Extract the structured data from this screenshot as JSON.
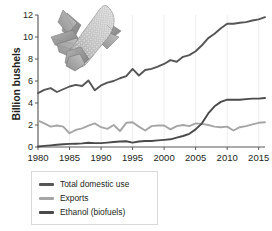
{
  "chart_data": {
    "type": "line",
    "title": "",
    "xlabel": "",
    "ylabel": "Billion bushels",
    "xlim": [
      1980,
      2016
    ],
    "ylim": [
      0,
      12
    ],
    "xticks": [
      1980,
      1985,
      1990,
      1995,
      2000,
      2005,
      2010,
      2015
    ],
    "yticks": [
      0,
      2,
      4,
      6,
      8,
      10,
      12
    ],
    "grid": "vertical",
    "legend_position": "below-left",
    "x": [
      1980,
      1981,
      1982,
      1983,
      1984,
      1985,
      1986,
      1987,
      1988,
      1989,
      1990,
      1991,
      1992,
      1993,
      1994,
      1995,
      1996,
      1997,
      1998,
      1999,
      2000,
      2001,
      2002,
      2003,
      2004,
      2005,
      2006,
      2007,
      2008,
      2009,
      2010,
      2011,
      2012,
      2013,
      2014,
      2015,
      2016
    ],
    "series": [
      {
        "name": "Total domestic use",
        "color": "#565656",
        "values": [
          4.9,
          5.2,
          5.35,
          5.0,
          5.25,
          5.5,
          5.65,
          5.55,
          6.05,
          5.15,
          5.6,
          5.85,
          6.0,
          6.25,
          6.45,
          7.1,
          6.5,
          7.0,
          7.1,
          7.3,
          7.55,
          7.9,
          7.75,
          8.2,
          8.35,
          8.7,
          9.25,
          9.9,
          10.3,
          10.8,
          11.2,
          11.2,
          11.3,
          11.35,
          11.5,
          11.6,
          11.8
        ]
      },
      {
        "name": "Exports",
        "color": "#a6a6a6",
        "values": [
          2.4,
          2.15,
          1.85,
          1.95,
          1.85,
          1.25,
          1.55,
          1.7,
          1.95,
          2.15,
          1.8,
          1.65,
          2.0,
          1.45,
          2.2,
          2.25,
          1.85,
          1.5,
          1.9,
          1.95,
          1.95,
          1.6,
          1.9,
          2.0,
          1.9,
          2.15,
          2.1,
          2.0,
          1.85,
          1.8,
          1.85,
          1.5,
          1.8,
          1.9,
          2.05,
          2.2,
          2.25
        ]
      },
      {
        "name": "Ethanol (biofuels)",
        "color": "#4a4a4a",
        "values": [
          0.05,
          0.1,
          0.15,
          0.2,
          0.25,
          0.28,
          0.3,
          0.33,
          0.38,
          0.35,
          0.35,
          0.4,
          0.45,
          0.5,
          0.52,
          0.4,
          0.5,
          0.55,
          0.55,
          0.6,
          0.65,
          0.7,
          0.85,
          1.0,
          1.2,
          1.6,
          2.15,
          3.05,
          3.7,
          4.1,
          4.3,
          4.3,
          4.3,
          4.35,
          4.4,
          4.4,
          4.45
        ]
      }
    ]
  },
  "axes": {
    "ylabel": "Billion bushels",
    "ytick_labels": [
      "0",
      "2",
      "4",
      "6",
      "8",
      "10",
      "12"
    ],
    "xtick_labels": [
      "1980",
      "1985",
      "1990",
      "1995",
      "2000",
      "2005",
      "2010",
      "2015"
    ]
  },
  "legend": {
    "items": [
      {
        "label": "Total domestic use",
        "color": "#565656"
      },
      {
        "label": "Exports",
        "color": "#a6a6a6"
      },
      {
        "label": "Ethanol (biofuels)",
        "color": "#4a4a4a"
      }
    ]
  },
  "illustration": {
    "name": "corn-cob-illustration"
  }
}
